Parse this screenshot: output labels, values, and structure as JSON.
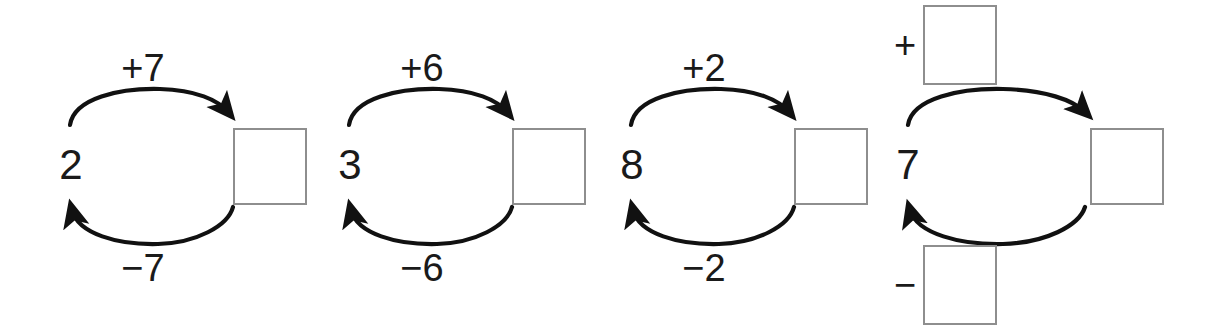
{
  "page": {
    "background_color": "#ffffff",
    "box_border_color": "#8e8e8e",
    "ink_color": "#1a1a1a"
  },
  "diagrams": [
    {
      "name": "diagram-1",
      "start_value": "2",
      "top_label": "+7",
      "bottom_label": "−7",
      "answer_value": "",
      "operator_boxes": false
    },
    {
      "name": "diagram-2",
      "start_value": "3",
      "top_label": "+6",
      "bottom_label": "−6",
      "answer_value": "",
      "operator_boxes": false
    },
    {
      "name": "diagram-3",
      "start_value": "8",
      "top_label": "+2",
      "bottom_label": "−2",
      "answer_value": "",
      "operator_boxes": false
    },
    {
      "name": "diagram-4",
      "start_value": "7",
      "top_label": "+",
      "bottom_label": "−",
      "answer_value": "",
      "operator_boxes": true,
      "top_box_value": "",
      "bottom_box_value": ""
    }
  ]
}
